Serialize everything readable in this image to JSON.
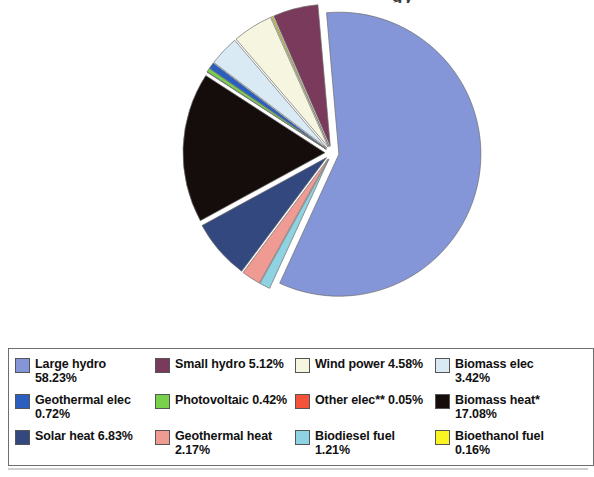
{
  "title": {
    "remnant_text": "gy"
  },
  "chart_data": {
    "type": "pie",
    "title": "",
    "legend_position": "bottom",
    "grid": false,
    "unit": "%",
    "categories": [
      "Large hydro",
      "Small hydro",
      "Wind power",
      "Biomass elec",
      "Geothermal elec",
      "Photovoltaic",
      "Other elec**",
      "Biomass heat*",
      "Solar heat",
      "Geothermal heat",
      "Biodiesel fuel",
      "Bioethanol fuel"
    ],
    "values": [
      58.23,
      5.12,
      4.58,
      3.42,
      0.72,
      0.42,
      0.05,
      17.08,
      6.83,
      2.17,
      1.21,
      0.16
    ],
    "colors": [
      "#8496d8",
      "#7a3a5c",
      "#f6f6e0",
      "#daeaf4",
      "#2a5fc0",
      "#77d14a",
      "#f4533a",
      "#150d0c",
      "#33487e",
      "#ef9b93",
      "#8fd2e2",
      "#fbf423"
    ],
    "slice_order_clockwise": [
      "Large hydro",
      "Biodiesel fuel",
      "Geothermal heat",
      "Solar heat",
      "Biomass heat*",
      "Other elec**",
      "Photovoltaic",
      "Geothermal elec",
      "Biomass elec",
      "Wind power",
      "Bioethanol fuel",
      "Small hydro"
    ],
    "exploded": true
  },
  "legend": {
    "items": [
      {
        "label": "Large hydro\n58.23%",
        "color": "#8496d8",
        "name": "large-hydro"
      },
      {
        "label": "Small hydro 5.12%",
        "color": "#7a3a5c",
        "name": "small-hydro"
      },
      {
        "label": "Wind power 4.58%",
        "color": "#f6f6e0",
        "name": "wind-power"
      },
      {
        "label": "Biomass elec\n3.42%",
        "color": "#daeaf4",
        "name": "biomass-elec"
      },
      {
        "label": "Geothermal elec\n0.72%",
        "color": "#2a5fc0",
        "name": "geothermal-elec"
      },
      {
        "label": "Photovoltaic 0.42%",
        "color": "#77d14a",
        "name": "photovoltaic"
      },
      {
        "label": "Other elec** 0.05%",
        "color": "#f4533a",
        "name": "other-elec"
      },
      {
        "label": "Biomass heat*\n17.08%",
        "color": "#150d0c",
        "name": "biomass-heat"
      },
      {
        "label": "Solar heat 6.83%",
        "color": "#33487e",
        "name": "solar-heat"
      },
      {
        "label": "Geothermal heat\n2.17%",
        "color": "#ef9b93",
        "name": "geothermal-heat"
      },
      {
        "label": "Biodiesel fuel\n1.21%",
        "color": "#8fd2e2",
        "name": "biodiesel-fuel"
      },
      {
        "label": "Bioethanol fuel\n0.16%",
        "color": "#fbf423",
        "name": "bioethanol-fuel"
      }
    ]
  }
}
